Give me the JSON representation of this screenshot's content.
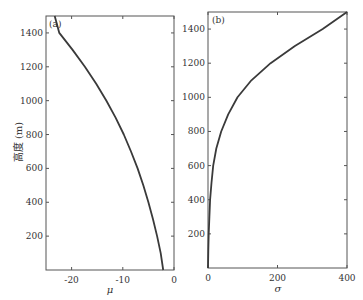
{
  "chart_data": [
    {
      "type": "line",
      "panel_label": "(a)",
      "title": "",
      "xlabel": "μ",
      "ylabel": "高度 (m)",
      "xlim": [
        -25,
        0
      ],
      "ylim": [
        0,
        1500
      ],
      "xticks": [
        -20,
        -10,
        0
      ],
      "xtick_labels": [
        "-20",
        "-10",
        "0"
      ],
      "yticks": [
        200,
        400,
        600,
        800,
        1000,
        1200,
        1400
      ],
      "ytick_labels": [
        "200",
        "400",
        "600",
        "800",
        "1000",
        "1200",
        "1400"
      ],
      "grid": false,
      "series": [
        {
          "name": "μ",
          "x": [
            -2.1,
            -2.6,
            -3.3,
            -4.1,
            -5.0,
            -6.0,
            -7.1,
            -8.4,
            -9.8,
            -11.4,
            -13.2,
            -15.2,
            -17.4,
            -19.8,
            -22.4,
            -23.3
          ],
          "y": [
            0,
            100,
            200,
            300,
            400,
            500,
            600,
            700,
            800,
            900,
            1000,
            1100,
            1200,
            1300,
            1400,
            1500
          ]
        }
      ]
    },
    {
      "type": "line",
      "panel_label": "(b)",
      "title": "",
      "xlabel": "σ",
      "ylabel": "",
      "xlim": [
        0,
        400
      ],
      "ylim": [
        0,
        1500
      ],
      "xticks": [
        0,
        200,
        400
      ],
      "xtick_labels": [
        "0",
        "200",
        "400"
      ],
      "yticks": [
        200,
        400,
        600,
        800,
        1000,
        1200,
        1400
      ],
      "ytick_labels": [
        "200",
        "400",
        "600",
        "800",
        "1000",
        "1200",
        "1400"
      ],
      "grid": false,
      "series": [
        {
          "name": "σ",
          "x": [
            0,
            1,
            2,
            4,
            6,
            10,
            15,
            24,
            38,
            58,
            85,
            125,
            180,
            250,
            330,
            400
          ],
          "y": [
            0,
            100,
            200,
            300,
            400,
            500,
            600,
            700,
            800,
            900,
            1000,
            1100,
            1200,
            1300,
            1400,
            1500
          ]
        }
      ]
    }
  ],
  "panels": [
    {
      "label": "(a)",
      "xlabel": "μ",
      "ylabel": "高度 (m)"
    },
    {
      "label": "(b)",
      "xlabel": "σ",
      "ylabel": ""
    }
  ]
}
